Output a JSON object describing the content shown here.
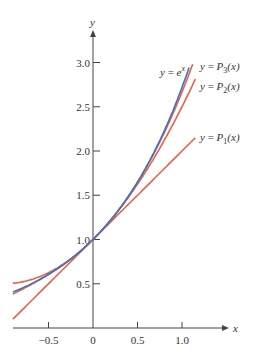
{
  "chart_data": {
    "type": "line",
    "title": "",
    "xlabel": "x",
    "ylabel": "y",
    "xlim": [
      -0.9,
      1.45
    ],
    "ylim": [
      0,
      3.3
    ],
    "x_ticks": [
      -0.5,
      0,
      0.5,
      1.0
    ],
    "x_tick_labels": [
      "−0.5",
      "0",
      "0.5",
      "1.0"
    ],
    "y_ticks": [
      0.5,
      1.0,
      1.5,
      2.0,
      2.5,
      3.0
    ],
    "y_tick_labels": [
      "0.5",
      "1.0",
      "1.5",
      "2.0",
      "2.5",
      "3.0"
    ],
    "grid": false,
    "series": [
      {
        "name": "y = e^x",
        "label_main": "y = e",
        "label_sup": "x",
        "color": "#3a74c0",
        "formula": "exp",
        "x_range": [
          -0.9,
          1.08
        ]
      },
      {
        "name": "y = P3(x)",
        "label_main": "y = P",
        "label_sub": "3",
        "label_tail": "(x)",
        "color": "#e8604a",
        "formula": "p3",
        "x_range": [
          -0.9,
          1.12
        ]
      },
      {
        "name": "y = P2(x)",
        "label_main": "y = P",
        "label_sub": "2",
        "label_tail": "(x)",
        "color": "#e8604a",
        "formula": "p2",
        "x_range": [
          -0.9,
          1.15
        ]
      },
      {
        "name": "y = P1(x)",
        "label_main": "y = P",
        "label_sub": "1",
        "label_tail": "(x)",
        "color": "#e8604a",
        "formula": "p1",
        "x_range": [
          -0.9,
          1.15
        ]
      }
    ],
    "annotations": [
      {
        "text": "y = e^x",
        "x": 0.92,
        "y": 3.0
      },
      {
        "text": "y = P3(x)",
        "x": 1.18,
        "y": 3.05
      },
      {
        "text": "y = P2(x)",
        "x": 1.18,
        "y": 2.75
      },
      {
        "text": "y = P1(x)",
        "x": 1.18,
        "y": 2.15
      }
    ]
  }
}
